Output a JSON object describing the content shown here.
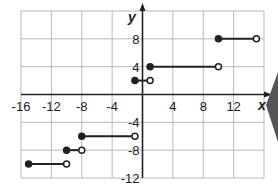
{
  "chart_data": {
    "type": "line",
    "subtype": "step-function",
    "title": "",
    "xlabel": "x",
    "ylabel": "y",
    "xlim": [
      -16,
      16
    ],
    "ylim": [
      -12,
      12
    ],
    "grid": true,
    "grid_step": 4,
    "x_ticks": [
      "-16",
      "-12",
      "-8",
      "-4",
      "4",
      "8",
      "12"
    ],
    "y_ticks": [
      "8",
      "4",
      "-4",
      "-8",
      "-12"
    ],
    "segments": [
      {
        "x_start": -15,
        "x_end": -10,
        "y": -10,
        "start_closed": true,
        "end_closed": false
      },
      {
        "x_start": -10,
        "x_end": -8,
        "y": -8,
        "start_closed": true,
        "end_closed": false
      },
      {
        "x_start": -8,
        "x_end": -1,
        "y": -6,
        "start_closed": true,
        "end_closed": false
      },
      {
        "x_start": -1,
        "x_end": 1,
        "y": 2,
        "start_closed": true,
        "end_closed": false
      },
      {
        "x_start": 1,
        "x_end": 10,
        "y": 4,
        "start_closed": true,
        "end_closed": false
      },
      {
        "x_start": 10,
        "x_end": 15,
        "y": 8,
        "start_closed": true,
        "end_closed": false
      }
    ]
  },
  "colors": {
    "line": "#222222",
    "grid": "#b8b8b8",
    "axis": "#222222",
    "edge_marker": "#555555"
  }
}
